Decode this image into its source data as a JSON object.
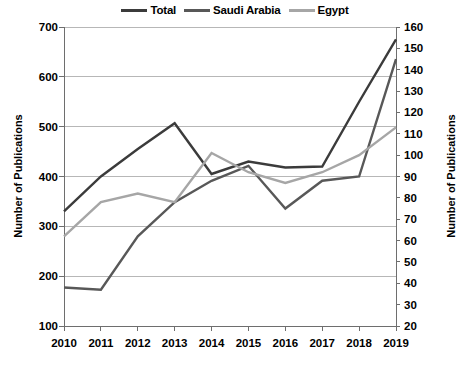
{
  "chart_data": {
    "type": "line",
    "title": "",
    "xlabel": "",
    "ylabel": "Number of Publications",
    "y2label": "Number of Publications",
    "categories": [
      "2010",
      "2011",
      "2012",
      "2013",
      "2014",
      "2015",
      "2016",
      "2017",
      "2018",
      "2019"
    ],
    "ylim": [
      100,
      700
    ],
    "yticks": [
      100,
      200,
      300,
      400,
      500,
      600,
      700
    ],
    "y2lim": [
      20,
      160
    ],
    "y2ticks": [
      20,
      30,
      40,
      50,
      60,
      70,
      80,
      90,
      100,
      110,
      120,
      130,
      140,
      150,
      160
    ],
    "grid": true,
    "legend_position": "top-center",
    "series": [
      {
        "name": "Total",
        "axis": "left",
        "color": "#3b3b3b",
        "values": [
          330,
          400,
          455,
          507,
          405,
          430,
          418,
          420,
          550,
          675
        ]
      },
      {
        "name": "Saudi Arabia",
        "axis": "right",
        "color": "#585858",
        "values": [
          38,
          37,
          62,
          78,
          88,
          95,
          75,
          88,
          90,
          145
        ]
      },
      {
        "name": "Egypt",
        "axis": "right",
        "color": "#a6a6a6",
        "values": [
          62,
          78,
          82,
          78,
          101,
          92,
          87,
          92,
          100,
          113
        ]
      }
    ]
  },
  "legend": {
    "items": [
      {
        "label": "Total",
        "color": "#3b3b3b"
      },
      {
        "label": "Saudi Arabia",
        "color": "#585858"
      },
      {
        "label": "Egypt",
        "color": "#a6a6a6"
      }
    ]
  },
  "axes": {
    "left_title": "Number of Publications",
    "right_title": "Number of Publications"
  },
  "colors": {
    "grid": "#b7b7b7",
    "axis": "#6e6e6e",
    "text": "#000000",
    "background": "#ffffff"
  }
}
